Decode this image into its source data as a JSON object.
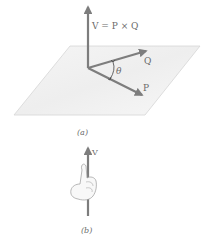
{
  "figure_a": {
    "vector_v_label": "V = P × Q",
    "vector_q_label": "Q",
    "vector_p_label": "P",
    "angle_label": "θ",
    "caption": "(a)"
  },
  "figure_b": {
    "vector_v_label": "V",
    "caption": "(b)"
  },
  "colors": {
    "arrow": "#7d7d7d",
    "plane_fill": "#f2f2f2",
    "plane_edge": "#d6d6d6",
    "text": "#6b6b6b"
  }
}
